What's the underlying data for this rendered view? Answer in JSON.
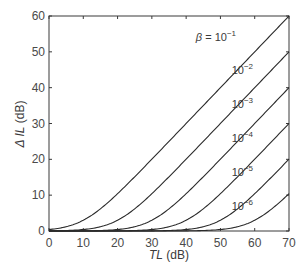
{
  "chart_data": {
    "type": "line",
    "title": "",
    "xlabel": "TL (dB)",
    "xlabel_italic": "TL",
    "xlabel_unit": " (dB)",
    "ylabel": "ΔIL (dB)",
    "ylabel_italic": "Δ IL",
    "ylabel_unit": " (dB)",
    "xlim": [
      0,
      70
    ],
    "ylim": [
      0,
      60
    ],
    "x_ticks": [
      0,
      10,
      20,
      30,
      40,
      50,
      60,
      70
    ],
    "y_ticks": [
      0,
      10,
      20,
      30,
      40,
      50,
      60
    ],
    "grid": false,
    "legend": "inline labels at right end of each curve",
    "model": "ΔIL = 10·log10(1 + β·10^(TL/10))",
    "x": [
      0,
      10,
      20,
      30,
      40,
      50,
      60,
      70
    ],
    "series": [
      {
        "name": "β = 10^-1",
        "beta": 0.1,
        "label_base": "β = 10",
        "label_exp": "−1",
        "values": [
          0.41,
          3.01,
          10.41,
          20.04,
          30.0,
          40.0,
          50.0,
          60.0
        ]
      },
      {
        "name": "10^-2",
        "beta": 0.01,
        "label_base": "10",
        "label_exp": "−2",
        "values": [
          0.04,
          0.41,
          3.01,
          10.41,
          20.04,
          30.0,
          40.0,
          50.0
        ]
      },
      {
        "name": "10^-3",
        "beta": 0.001,
        "label_base": "10",
        "label_exp": "−3",
        "values": [
          0.0,
          0.04,
          0.41,
          3.01,
          10.41,
          20.04,
          30.0,
          40.0
        ]
      },
      {
        "name": "10^-4",
        "beta": 0.0001,
        "label_base": "10",
        "label_exp": "−4",
        "values": [
          0.0,
          0.0,
          0.04,
          0.41,
          3.01,
          10.41,
          20.04,
          30.0
        ]
      },
      {
        "name": "10^-5",
        "beta": 1e-05,
        "label_base": "10",
        "label_exp": "−5",
        "values": [
          0.0,
          0.0,
          0.0,
          0.04,
          0.41,
          3.01,
          10.41,
          20.04
        ]
      },
      {
        "name": "10^-6",
        "beta": 1e-06,
        "label_base": "10",
        "label_exp": "−6",
        "values": [
          0.0,
          0.0,
          0.0,
          0.0,
          0.04,
          0.41,
          3.01,
          10.41
        ]
      }
    ]
  },
  "style": {
    "line_color": "#2a2a2a",
    "axis_color": "#3a3a3a",
    "background": "#ffffff"
  }
}
